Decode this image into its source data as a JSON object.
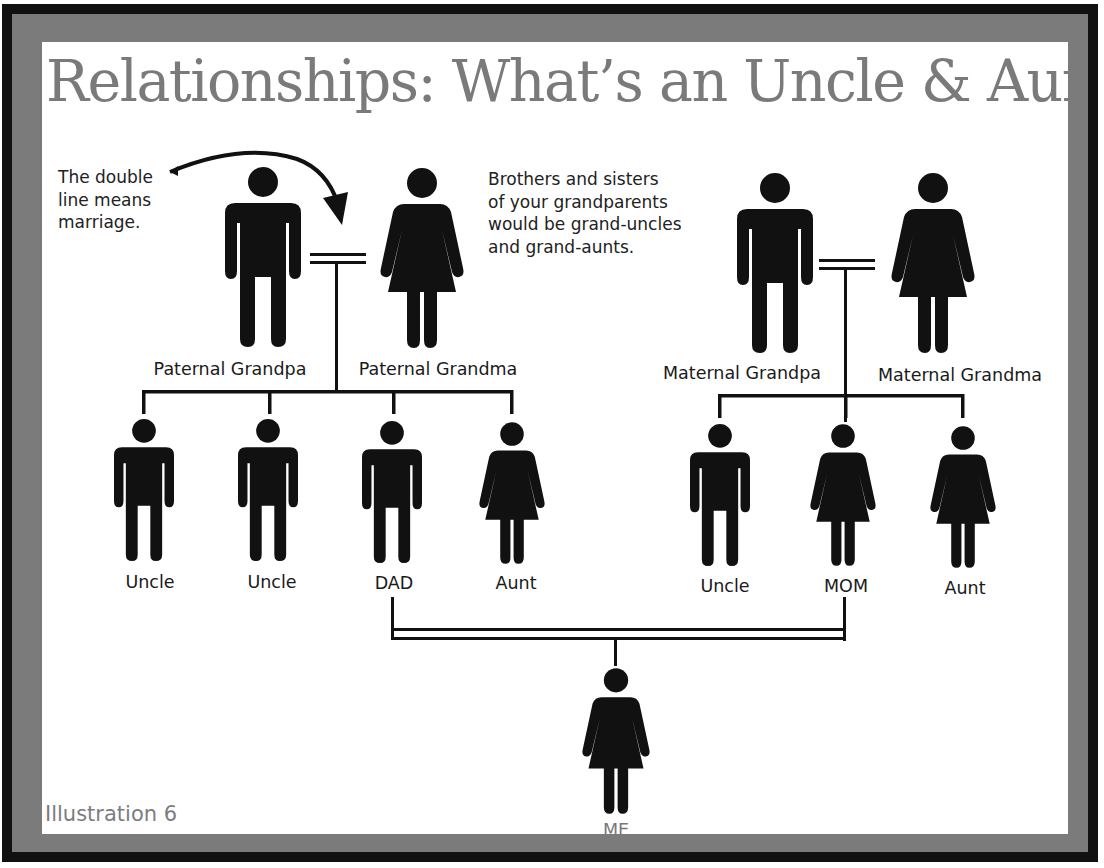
{
  "title": "Relationships: What’s an Uncle & Aunt?",
  "notes": {
    "marriage": "The double\nline means\nmarriage.",
    "grand_relatives": "Brothers and sisters\nof your grandparents\nwould be grand-uncles\nand grand-aunts."
  },
  "grandparents": {
    "paternal_grandpa": "Paternal Grandpa",
    "paternal_grandma": "Paternal Grandma",
    "maternal_grandpa": "Maternal Grandpa",
    "maternal_grandma": "Maternal Grandma"
  },
  "paternal_children": [
    {
      "label": "Uncle",
      "gender": "male"
    },
    {
      "label": "Uncle",
      "gender": "male"
    },
    {
      "label": "DAD",
      "gender": "male"
    },
    {
      "label": "Aunt",
      "gender": "female"
    }
  ],
  "maternal_children": [
    {
      "label": "Uncle",
      "gender": "male"
    },
    {
      "label": "MOM",
      "gender": "female"
    },
    {
      "label": "Aunt",
      "gender": "female"
    }
  ],
  "self": {
    "label": "ME",
    "gender": "female"
  },
  "footer": "Illustration 6",
  "icons": {
    "male": "male-person-icon",
    "female": "female-person-icon",
    "marriage": "double-line-marriage-connector",
    "arrow": "curved-arrow-icon"
  },
  "colors": {
    "frame_outer": "#111111",
    "frame": "#7b7b7b",
    "panel": "#ffffff",
    "title": "#7a7a7a",
    "figure": "#111111",
    "footer_text": "#7d7d7d"
  }
}
